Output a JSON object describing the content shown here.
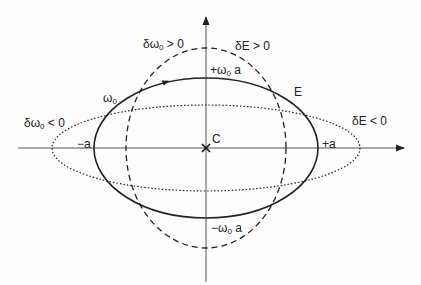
{
  "diagram": {
    "type": "phase-space-ellipses",
    "colors": {
      "stroke": "#222222",
      "axis": "#555555",
      "background": "#fdfdfd"
    },
    "origin": {
      "label": "C"
    },
    "axes": {
      "horizontal": {
        "arrow": "right"
      },
      "vertical": {
        "arrow": "up"
      }
    },
    "curves": [
      {
        "id": "nominal",
        "style": "solid",
        "label": "E",
        "rx_label_pos": "+a",
        "rx_label_neg": "-a",
        "ry_label_pos": "+ω0 a",
        "ry_label_neg": "-ω0 a",
        "point_label": "ω0"
      },
      {
        "id": "delta-omega-positive",
        "style": "dashed",
        "label": "δω0 > 0"
      },
      {
        "id": "delta-E-positive",
        "style": "dashed",
        "label": "δE > 0"
      },
      {
        "id": "delta-omega-negative",
        "style": "dotted",
        "label": "δω0 < 0"
      },
      {
        "id": "delta-E-negative",
        "style": "dotted",
        "label": "δE < 0"
      }
    ]
  },
  "labels": {
    "origin": "C",
    "energy": "E",
    "omega_base": "ω",
    "omega_sub": "0",
    "plus_a": "+a",
    "minus_a": "−a",
    "plus_omega_a_prefix": "+ω",
    "plus_omega_a_sub": "0",
    "plus_omega_a_suffix": " a",
    "minus_omega_a_prefix": "−ω",
    "minus_omega_a_sub": "0",
    "minus_omega_a_suffix": " a",
    "d_omega_pos_prefix": "δω",
    "d_omega_pos_sub": "0",
    "d_omega_pos_suffix": " > 0",
    "d_omega_neg_prefix": "δω",
    "d_omega_neg_sub": "0",
    "d_omega_neg_suffix": " < 0",
    "d_E_pos": "δE > 0",
    "d_E_neg": "δE < 0"
  }
}
